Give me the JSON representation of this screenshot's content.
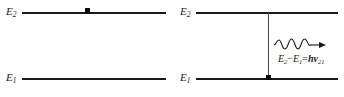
{
  "figure": {
    "line_color": "#1a1a1a",
    "marker_color": "#0a0a0a",
    "background": "#ffffff"
  },
  "panels": [
    {
      "id": "left",
      "name": "excited-state-panel",
      "levels": [
        {
          "id": "E2",
          "label": "E",
          "sub": "2",
          "name": "upper-energy-level"
        },
        {
          "id": "E1",
          "label": "E",
          "sub": "1",
          "name": "lower-energy-level"
        }
      ],
      "electron_on_level": "E2"
    },
    {
      "id": "right",
      "name": "emission-panel",
      "levels": [
        {
          "id": "E2",
          "label": "E",
          "sub": "2",
          "name": "upper-energy-level"
        },
        {
          "id": "E1",
          "label": "E",
          "sub": "1",
          "name": "lower-energy-level"
        }
      ],
      "electron_on_level": "E1",
      "transition": {
        "name": "downward-transition",
        "direction": "down",
        "from": "E2",
        "to": "E1"
      },
      "photon": {
        "name": "emitted-photon",
        "direction": "right",
        "glyph": "wavy-arrow-icon"
      },
      "equation": {
        "left_term": "E",
        "left_sub": "2",
        "operator_minus": "−",
        "right_term": "E",
        "right_sub": "1",
        "equals": "=",
        "planck": "h",
        "nu": "ν",
        "nu_sub": "21",
        "plain": "E2−E1=hν21"
      }
    }
  ]
}
